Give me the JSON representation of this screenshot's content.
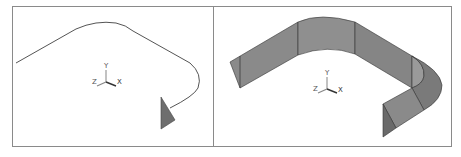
{
  "figure": {
    "panels": [
      {
        "id": "left",
        "description": "Sweep path curve with profile section",
        "axis_triad": {
          "x_label": "X",
          "y_label": "Y",
          "z_label": "Z"
        }
      },
      {
        "id": "right",
        "description": "Resulting swept surface",
        "axis_triad": {
          "x_label": "X",
          "y_label": "Y",
          "z_label": "Z"
        }
      }
    ],
    "colors": {
      "frame": "#8a8a8a",
      "curve": "#555555",
      "profile_fill": "#6e6e6e",
      "surface_fill": "#8c8c8c",
      "surface_dark": "#6f6f6f",
      "surface_edge": "#2e2e2e"
    }
  }
}
